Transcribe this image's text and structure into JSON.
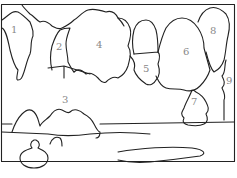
{
  "regions": [
    {
      "id": "1",
      "label": "1"
    },
    {
      "id": "2",
      "label": "2"
    },
    {
      "id": "3",
      "label": "3"
    },
    {
      "id": "4",
      "label": "4"
    },
    {
      "id": "5",
      "label": "5"
    },
    {
      "id": "6",
      "label": "6"
    },
    {
      "id": "7",
      "label": "7"
    },
    {
      "id": "8",
      "label": "8"
    },
    {
      "id": "9",
      "label": "9"
    }
  ],
  "colors": {
    "line": "#222222",
    "label": "#888888",
    "background": "#ffffff"
  }
}
